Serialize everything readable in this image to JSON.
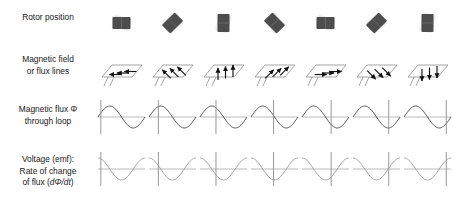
{
  "figure": {
    "columns": 7,
    "column_pitch_px": 51,
    "colors": {
      "rotor_magnet": "#4d4d4d",
      "rotor_blur": "#cccccc",
      "loop_outline": "#9a9a9a",
      "arrow": "#111111",
      "flux_curve": "#555555",
      "emf_curve": "#9a9a9a",
      "axis": "#aaaaaa",
      "marker": "#8c8c8c",
      "text": "#1a1a1a",
      "background": "#ffffff"
    }
  },
  "rows": [
    {
      "id": "rotor-position",
      "label": "Rotor position",
      "label_lines": [
        "Rotor position"
      ]
    },
    {
      "id": "magnetic-field",
      "label": "Magnetic field or flux lines",
      "label_lines": [
        "Magnetic field",
        "or flux lines"
      ]
    },
    {
      "id": "magnetic-flux",
      "label": "Magnetic flux Φ through loop",
      "label_lines": [
        "Magnetic flux Φ",
        "through loop"
      ]
    },
    {
      "id": "voltage-emf",
      "label": "Voltage (emf): Rate of change of flux (dΦ/dt)",
      "label_lines": [
        "Voltage (emf):",
        "Rate of change",
        "of flux (dΦ/dt)"
      ]
    }
  ],
  "columns": [
    {
      "index": 0,
      "rotor_angle_deg": 0,
      "rotor_orientation": "horizontal",
      "field_direction": "left",
      "field_arrow_angle_deg": 180,
      "arrow_count": 3,
      "flux_phase_deg": 0,
      "flux_marker_fraction": 0.06,
      "flux_value": 0,
      "emf_value": 1
    },
    {
      "index": 1,
      "rotor_angle_deg": 45,
      "rotor_orientation": "diagonal-up-right",
      "field_direction": "up-left-diagonal",
      "field_arrow_angle_deg": 135,
      "arrow_count": 3,
      "flux_phase_deg": 45,
      "flux_marker_fraction": 0.2,
      "flux_value": 0.707,
      "emf_value": 0.707
    },
    {
      "index": 2,
      "rotor_angle_deg": 90,
      "rotor_orientation": "vertical",
      "field_direction": "up",
      "field_arrow_angle_deg": 90,
      "arrow_count": 3,
      "flux_phase_deg": 90,
      "flux_marker_fraction": 0.34,
      "flux_value": 1,
      "emf_value": 0
    },
    {
      "index": 3,
      "rotor_angle_deg": 135,
      "rotor_orientation": "diagonal-up-left",
      "field_direction": "up-right-diagonal",
      "field_arrow_angle_deg": 45,
      "arrow_count": 3,
      "flux_phase_deg": 135,
      "flux_marker_fraction": 0.48,
      "flux_value": 0.707,
      "emf_value": -0.707
    },
    {
      "index": 4,
      "rotor_angle_deg": 180,
      "rotor_orientation": "horizontal",
      "field_direction": "right",
      "field_arrow_angle_deg": 0,
      "arrow_count": 3,
      "flux_phase_deg": 180,
      "flux_marker_fraction": 0.62,
      "flux_value": 0,
      "emf_value": -1
    },
    {
      "index": 5,
      "rotor_angle_deg": 225,
      "rotor_orientation": "diagonal-up-right",
      "field_direction": "down-right-diagonal",
      "field_arrow_angle_deg": -45,
      "arrow_count": 3,
      "flux_phase_deg": 225,
      "flux_marker_fraction": 0.76,
      "flux_value": -0.707,
      "emf_value": -0.707
    },
    {
      "index": 6,
      "rotor_angle_deg": 270,
      "rotor_orientation": "vertical",
      "field_direction": "down",
      "field_arrow_angle_deg": -90,
      "arrow_count": 3,
      "flux_phase_deg": 270,
      "flux_marker_fraction": 0.9,
      "flux_value": -1,
      "emf_value": 0
    }
  ],
  "chart_data": {
    "type": "line",
    "xlabel": "",
    "ylabel": "",
    "x": [
      0,
      45,
      90,
      135,
      180,
      225,
      270
    ],
    "xlim": [
      0,
      360
    ],
    "ylim": [
      -1,
      1
    ],
    "grid": false,
    "legend": "none",
    "series": [
      {
        "name": "Magnetic flux Φ through loop",
        "waveform": "sine",
        "values": [
          0,
          0.707,
          1,
          0.707,
          0,
          -0.707,
          -1
        ]
      },
      {
        "name": "Voltage (emf): rate of change of flux (dΦ/dt)",
        "waveform": "cosine",
        "values": [
          1,
          0.707,
          0,
          -0.707,
          -1,
          -0.707,
          0
        ]
      }
    ]
  }
}
